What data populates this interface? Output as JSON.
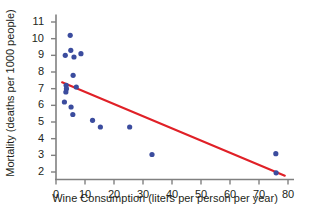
{
  "chart_data": {
    "type": "scatter",
    "title": "",
    "xlabel": "Wine Consumption (liters per person per year)",
    "ylabel": "Mortality (deaths per 1000 people)",
    "xlim": [
      0,
      80
    ],
    "ylim": [
      1.55,
      11.4
    ],
    "xticks": [
      0,
      10,
      20,
      30,
      40,
      50,
      60,
      70,
      80
    ],
    "yticks": [
      2,
      3,
      4,
      5,
      6,
      7,
      8,
      9,
      10,
      11
    ],
    "grid": false,
    "legend": null,
    "point_color": "#3b4c9e",
    "line_color": "#e02027",
    "axis_color": "#808080",
    "series": [
      {
        "name": "Countries",
        "points": [
          [
            4.9,
            10.2
          ],
          [
            3.2,
            9.0
          ],
          [
            5.1,
            9.3
          ],
          [
            6.2,
            8.9
          ],
          [
            8.6,
            9.1
          ],
          [
            5.9,
            7.8
          ],
          [
            3.5,
            7.2
          ],
          [
            3.6,
            7.0
          ],
          [
            7.0,
            7.1
          ],
          [
            3.4,
            6.8
          ],
          [
            2.9,
            6.2
          ],
          [
            5.2,
            5.9
          ],
          [
            5.8,
            5.45
          ],
          [
            12.6,
            5.1
          ],
          [
            15.3,
            4.7
          ],
          [
            25.4,
            4.7
          ],
          [
            33.1,
            3.05
          ],
          [
            75.8,
            3.1
          ],
          [
            75.9,
            1.95
          ]
        ]
      }
    ],
    "trendline": {
      "name": "least-squares fit",
      "x_start": 2.1,
      "y_start": 7.38,
      "x_end": 78.9,
      "y_end": 1.78,
      "color": "#e02027"
    }
  }
}
